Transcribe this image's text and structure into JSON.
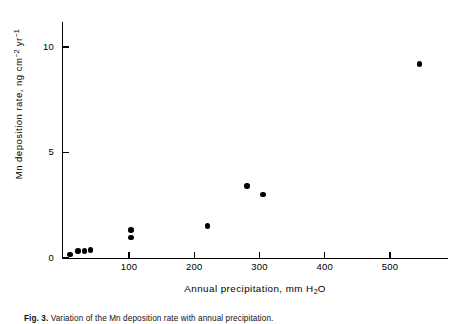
{
  "figure": {
    "caption_label": "Fig. 3.",
    "caption_text": "Variation of the Mn deposition rate with annual precipitation."
  },
  "axes": {
    "y_title_main": "Mn deposition rate, ng cm",
    "y_title_exp1": "−2",
    "y_title_mid": " yr",
    "y_title_exp2": "−1",
    "x_title_main": "Annual precipitation, mm H",
    "x_title_sub": "2",
    "x_title_end": "O"
  },
  "chart_data": {
    "type": "scatter",
    "title": "",
    "xlabel": "Annual precipitation, mm H2O",
    "ylabel": "Mn deposition rate, ng cm-2 yr-1",
    "xlim": [
      0,
      592
    ],
    "ylim": [
      0,
      11.2
    ],
    "xticks": [
      100,
      200,
      300,
      400,
      500
    ],
    "xtick_labels": [
      "100",
      "200",
      "300",
      "400",
      "500"
    ],
    "yticks": [
      0,
      5,
      10
    ],
    "ytick_labels": [
      "0",
      "5",
      "10"
    ],
    "grid": false,
    "legend": null,
    "marker": "filled-circle",
    "points": [
      {
        "x": 10,
        "y": 0.15
      },
      {
        "x": 22,
        "y": 0.3
      },
      {
        "x": 32,
        "y": 0.32
      },
      {
        "x": 41,
        "y": 0.35
      },
      {
        "x": 103,
        "y": 1.3
      },
      {
        "x": 103,
        "y": 0.95
      },
      {
        "x": 220,
        "y": 1.5
      },
      {
        "x": 281,
        "y": 3.4
      },
      {
        "x": 305,
        "y": 3.0
      },
      {
        "x": 545,
        "y": 9.2
      }
    ]
  }
}
